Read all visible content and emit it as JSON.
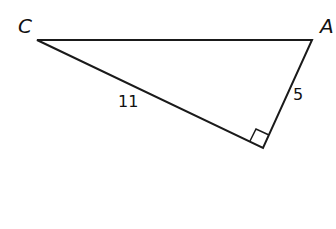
{
  "diagram": {
    "type": "right-triangle",
    "vertices": [
      {
        "name": "C",
        "x": 37,
        "y": 40
      },
      {
        "name": "A",
        "x": 312,
        "y": 40
      },
      {
        "name": "B",
        "x": 263,
        "y": 148
      }
    ],
    "labels": {
      "vertex_c": "C",
      "vertex_a": "A",
      "side_cb": "11",
      "side_ab": "5"
    },
    "right_angle_at": "unlabeled bottom vertex",
    "stroke_color": "#1a1a1a"
  }
}
